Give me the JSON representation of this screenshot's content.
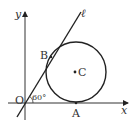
{
  "diagram": {
    "axes": {
      "x_label": "x",
      "y_label": "y"
    },
    "origin_label": "O",
    "line_label": "ℓ",
    "angle_label": "60°",
    "points": {
      "A": "A",
      "B": "B",
      "C": "C"
    },
    "relations": {
      "circle_tangent_to": [
        "x-axis",
        "line ℓ"
      ],
      "tangent_points": {
        "x-axis": "A",
        "line ℓ": "B"
      },
      "circle_center": "C",
      "line_angle_with_x_axis_deg": 60
    }
  }
}
